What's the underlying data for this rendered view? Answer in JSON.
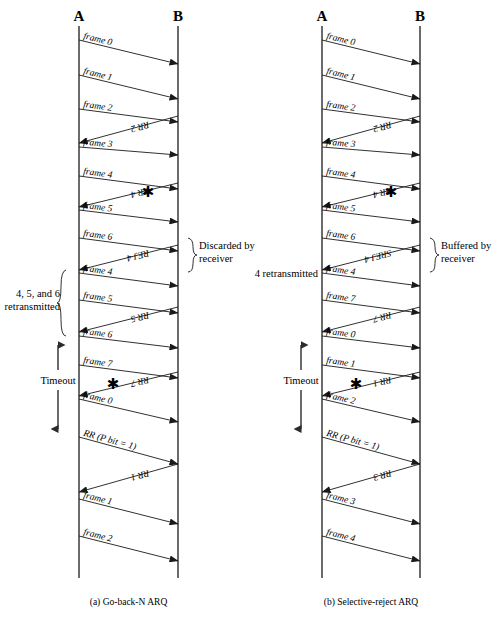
{
  "figure": {
    "title": "",
    "panels": [
      {
        "id": "panel-a",
        "caption": "(a) Go-back-N ARQ",
        "sender_label": "A",
        "receiver_label": "B",
        "sender_x": 79,
        "receiver_x": 178,
        "lifeline_top": 26,
        "lifeline_bottom": 578,
        "messages": [
          {
            "label": "frame 0",
            "dir": "send",
            "y0": 40,
            "y1": 64
          },
          {
            "label": "frame 1",
            "dir": "send",
            "y0": 75,
            "y1": 99
          },
          {
            "label": "frame 2",
            "dir": "send",
            "y0": 109,
            "y1": 122
          },
          {
            "label": "RR 2",
            "dir": "recv",
            "y0": 116,
            "y1": 143
          },
          {
            "label": "frame 3",
            "dir": "send",
            "y0": 147,
            "y1": 155
          },
          {
            "label": "frame 4",
            "dir": "send",
            "y0": 176,
            "y1": 189
          },
          {
            "label": "RR 4",
            "dir": "recv",
            "y0": 183,
            "y1": 207
          },
          {
            "label": "frame 5",
            "dir": "send",
            "y0": 210,
            "y1": 222
          },
          {
            "label": "frame 6",
            "dir": "send",
            "y0": 238,
            "y1": 251
          },
          {
            "label": "REJ 4",
            "dir": "recv",
            "y0": 245,
            "y1": 270
          },
          {
            "label": "frame 4",
            "dir": "send",
            "y0": 273,
            "y1": 286
          },
          {
            "label": "frame 5",
            "dir": "send",
            "y0": 300,
            "y1": 313
          },
          {
            "label": "RR 5",
            "dir": "recv",
            "y0": 307,
            "y1": 332
          },
          {
            "label": "frame 6",
            "dir": "send",
            "y0": 336,
            "y1": 348
          },
          {
            "label": "frame 7",
            "dir": "send",
            "y0": 365,
            "y1": 378
          },
          {
            "label": "RR 7",
            "dir": "recv",
            "y0": 372,
            "y1": 396
          },
          {
            "label": "frame 0",
            "dir": "send",
            "y0": 399,
            "y1": 422
          },
          {
            "label": "RR (P bit = 1)",
            "dir": "send",
            "y0": 437,
            "y1": 464
          },
          {
            "label": "RR 1",
            "dir": "recv",
            "y0": 464,
            "y1": 492
          },
          {
            "label": "frame 1",
            "dir": "send",
            "y0": 499,
            "y1": 524
          },
          {
            "label": "frame 2",
            "dir": "send",
            "y0": 536,
            "y1": 561
          }
        ],
        "error_markers": [
          {
            "name": "corruption-marker",
            "glyph": "✱",
            "x": 148,
            "y": 197
          },
          {
            "name": "corruption-marker",
            "glyph": "✱",
            "x": 113,
            "y": 389
          }
        ],
        "braces": [
          {
            "name": "discarded-brace",
            "side": "right",
            "x": 188,
            "y_top": 238,
            "y_bottom": 272,
            "text_lines": [
              "Discarded by",
              "receiver"
            ],
            "text_x": 199,
            "text_y": 249
          },
          {
            "name": "retransmitted-brace",
            "side": "left",
            "x": 66,
            "y_top": 270,
            "y_bottom": 336,
            "text_lines": [
              "4, 5, and 6",
              "retransmitted"
            ],
            "text_x": 60,
            "text_y": 297,
            "text_anchor": "end"
          }
        ],
        "timeout": {
          "label": "Timeout",
          "x": 58,
          "y_top": 337,
          "y_bottom": 437,
          "label_x": 58,
          "label_y": 384
        }
      },
      {
        "id": "panel-b",
        "caption": "(b) Selective-reject ARQ",
        "sender_label": "A",
        "receiver_label": "B",
        "sender_x": 322,
        "receiver_x": 420,
        "lifeline_top": 26,
        "lifeline_bottom": 578,
        "messages": [
          {
            "label": "frame 0",
            "dir": "send",
            "y0": 40,
            "y1": 64
          },
          {
            "label": "frame 1",
            "dir": "send",
            "y0": 75,
            "y1": 99
          },
          {
            "label": "frame 2",
            "dir": "send",
            "y0": 109,
            "y1": 122
          },
          {
            "label": "RR 2",
            "dir": "recv",
            "y0": 116,
            "y1": 143
          },
          {
            "label": "frame 3",
            "dir": "send",
            "y0": 147,
            "y1": 155
          },
          {
            "label": "frame 4",
            "dir": "send",
            "y0": 176,
            "y1": 189
          },
          {
            "label": "RR 4",
            "dir": "recv",
            "y0": 183,
            "y1": 207
          },
          {
            "label": "frame 5",
            "dir": "send",
            "y0": 210,
            "y1": 222
          },
          {
            "label": "frame 6",
            "dir": "send",
            "y0": 238,
            "y1": 251
          },
          {
            "label": "SREJ 4",
            "dir": "recv",
            "y0": 245,
            "y1": 270
          },
          {
            "label": "frame 4",
            "dir": "send",
            "y0": 273,
            "y1": 286
          },
          {
            "label": "frame 7",
            "dir": "send",
            "y0": 300,
            "y1": 313
          },
          {
            "label": "RR 7",
            "dir": "recv",
            "y0": 307,
            "y1": 332
          },
          {
            "label": "frame 0",
            "dir": "send",
            "y0": 336,
            "y1": 348
          },
          {
            "label": "frame 1",
            "dir": "send",
            "y0": 365,
            "y1": 378
          },
          {
            "label": "RR 1",
            "dir": "recv",
            "y0": 372,
            "y1": 396
          },
          {
            "label": "frame 2",
            "dir": "send",
            "y0": 399,
            "y1": 422
          },
          {
            "label": "RR (P bit = 1)",
            "dir": "send",
            "y0": 437,
            "y1": 464
          },
          {
            "label": "RR 3",
            "dir": "recv",
            "y0": 464,
            "y1": 492
          },
          {
            "label": "frame 3",
            "dir": "send",
            "y0": 499,
            "y1": 524
          },
          {
            "label": "frame 4",
            "dir": "send",
            "y0": 536,
            "y1": 561
          }
        ],
        "error_markers": [
          {
            "name": "corruption-marker",
            "glyph": "✱",
            "x": 391,
            "y": 197
          },
          {
            "name": "corruption-marker",
            "glyph": "✱",
            "x": 356,
            "y": 389
          }
        ],
        "braces": [
          {
            "name": "buffered-brace",
            "side": "right",
            "x": 430,
            "y_top": 238,
            "y_bottom": 272,
            "text_lines": [
              "Buffered by",
              "receiver"
            ],
            "text_x": 441,
            "text_y": 249
          },
          {
            "name": "retransmitted-note",
            "side": "none",
            "x": 0,
            "y_top": 0,
            "y_bottom": 0,
            "text_lines": [
              "4 retransmitted"
            ],
            "text_x": 318,
            "text_y": 277,
            "text_anchor": "end"
          }
        ],
        "timeout": {
          "label": "Timeout",
          "x": 301,
          "y_top": 337,
          "y_bottom": 437,
          "label_x": 301,
          "label_y": 384
        }
      }
    ]
  }
}
